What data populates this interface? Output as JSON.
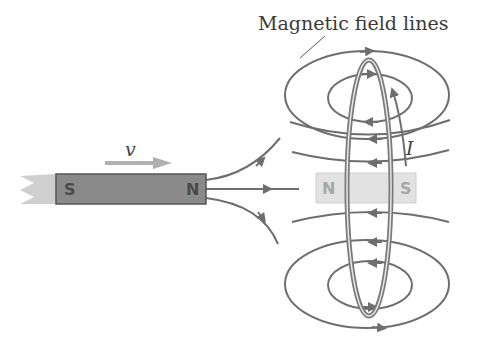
{
  "diagram": {
    "title_label": "Magnetic field lines",
    "velocity_label": "v",
    "current_label": "I",
    "moving_magnet": {
      "left_pole": "S",
      "right_pole": "N",
      "color": "#8a8a8a"
    },
    "induced_magnet": {
      "left_pole": "N",
      "right_pole": "S",
      "color": "#e0e0e0"
    },
    "colors": {
      "line": "#6e6e6e",
      "arrow": "#b0b0b0",
      "loop": "#7a7a7a",
      "text": "#3a3a3a"
    }
  }
}
